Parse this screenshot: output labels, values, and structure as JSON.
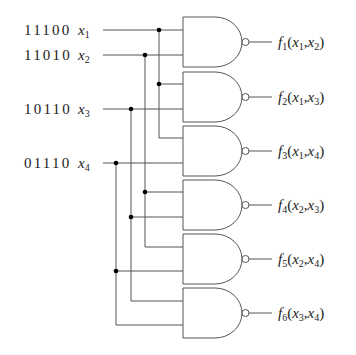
{
  "diagram": {
    "type": "logic-circuit",
    "colors": {
      "wire": "#555555",
      "junction": "#000000",
      "text": "#222222",
      "background": "#ffffff"
    },
    "inputs": [
      {
        "id": "x1",
        "pattern": "11100",
        "var": "x",
        "sub": "1",
        "y": 30
      },
      {
        "id": "x2",
        "pattern": "11010",
        "var": "x",
        "sub": "2",
        "y": 55
      },
      {
        "id": "x3",
        "pattern": "10110",
        "var": "x",
        "sub": "3",
        "y": 109
      },
      {
        "id": "x4",
        "pattern": "01110",
        "var": "x",
        "sub": "4",
        "y": 163
      }
    ],
    "gates": [
      {
        "id": "g1",
        "type": "NAND",
        "top": 17,
        "inputs": [
          "x1",
          "x2"
        ],
        "output": {
          "f": "f",
          "fsub": "1",
          "a": "1",
          "b": "2"
        }
      },
      {
        "id": "g2",
        "type": "NAND",
        "top": 72,
        "inputs": [
          "x1",
          "x3"
        ],
        "output": {
          "f": "f",
          "fsub": "2",
          "a": "1",
          "b": "3"
        }
      },
      {
        "id": "g3",
        "type": "NAND",
        "top": 126,
        "inputs": [
          "x1",
          "x4"
        ],
        "output": {
          "f": "f",
          "fsub": "3",
          "a": "1",
          "b": "4"
        }
      },
      {
        "id": "g4",
        "type": "NAND",
        "top": 180,
        "inputs": [
          "x2",
          "x3"
        ],
        "output": {
          "f": "f",
          "fsub": "4",
          "a": "2",
          "b": "3"
        }
      },
      {
        "id": "g5",
        "type": "NAND",
        "top": 234,
        "inputs": [
          "x2",
          "x4"
        ],
        "output": {
          "f": "f",
          "fsub": "5",
          "a": "2",
          "b": "4"
        }
      },
      {
        "id": "g6",
        "type": "NAND",
        "top": 288,
        "inputs": [
          "x3",
          "x4"
        ],
        "output": {
          "f": "f",
          "fsub": "6",
          "a": "3",
          "b": "4"
        }
      }
    ],
    "output_labels": [
      "f1(x1,x2)",
      "f2(x1,x3)",
      "f3(x1,x4)",
      "f4(x2,x3)",
      "f5(x2,x4)",
      "f6(x3,x4)"
    ]
  }
}
